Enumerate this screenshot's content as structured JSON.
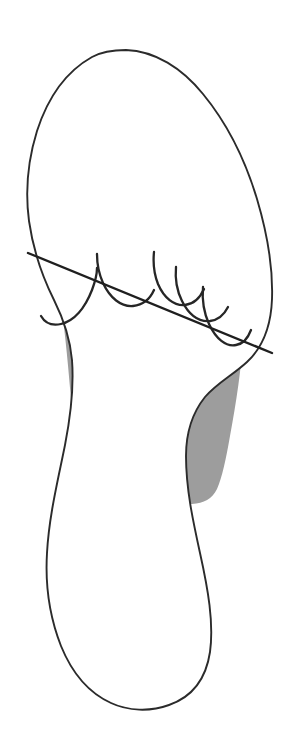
{
  "figure": {
    "caption": "",
    "background_color": "#ffffff",
    "width": 290,
    "height": 746
  },
  "colors": {
    "outline_stroke": "#2b2b2b",
    "shaded_fill": "#9d9d9d",
    "arc_stroke": "#262626",
    "reference_line_stroke": "#1f1f1f",
    "page_background": "#ffffff"
  },
  "shapes": {
    "foot_outline": {
      "name": "foot-outline",
      "label": "",
      "stroke_width": 1.9,
      "path": "M 126 50 C 155 51 182 68 203 94 C 226 122 245 159 257 199 C 268 236 273 271 272 299 C 271 327 262 348 247 362 C 233 375 217 383 205 397 C 193 412 186 432 186 456 C 186 489 193 521 200 553 C 208 589 214 623 210 652 C 206 679 192 697 169 705 C 150 712 128 711 111 703 C 89 693 72 673 61 646 C 50 618 45 586 47 553 C 49 516 58 480 65 445 C 71 414 74 386 72 360 C 70 337 63 318 54 300 C 42 276 33 249 29 221 C 25 191 28 160 37 131 C 48 97 67 71 92 57 C 103 51 114 50 126 50 Z"
    },
    "shaded_forefoot": {
      "name": "shaded-forefoot-region",
      "label": "",
      "fill": "#9d9d9d",
      "path": "M 47 250 C 62 244 80 239 100 236 C 128 232 158 234 182 242 C 203 249 219 261 229 276 C 240 292 244 311 243 334 C 242 366 236 404 230 436 C 226 459 222 478 217 489 C 212 499 204 503 192 504 C 170 506 136 506 110 503 C 94 501 86 496 82 486 C 78 475 76 456 74 433 C 71 400 68 361 64 327 C 61 300 56 276 50 259 Z"
    }
  },
  "reference_line": {
    "name": "metatarsal-reference-line",
    "label": "",
    "description": "straight diagonal line crossing the forefoot",
    "start": [
      28,
      253
    ],
    "end": [
      272,
      353
    ],
    "path": "M 28 253 L 272 353"
  },
  "joint_arcs": [
    {
      "name": "joint-arc-1",
      "path": "M 41 316 C 45 323 52 326 61 324 C 74 321 85 308 92 290 C 95 282 97 274 97 268"
    },
    {
      "name": "joint-arc-2",
      "path": "M 97 254 C 97 263 99 274 103 283 C 110 298 121 307 133 306 C 143 305 150 299 154 290"
    },
    {
      "name": "joint-arc-3",
      "path": "M 154 252 C 153 262 154 274 158 284 C 164 298 174 306 185 305 C 194 304 200 298 204 289"
    },
    {
      "name": "joint-arc-4",
      "path": "M 176 267 C 175 278 177 291 182 301 C 189 315 199 322 210 321 C 218 320 224 315 228 307"
    },
    {
      "name": "joint-arc-5",
      "path": "M 203 287 C 202 299 204 313 209 324 C 216 339 226 347 236 345 C 243 344 248 338 251 330"
    }
  ],
  "annotations": {
    "visible_text": []
  }
}
